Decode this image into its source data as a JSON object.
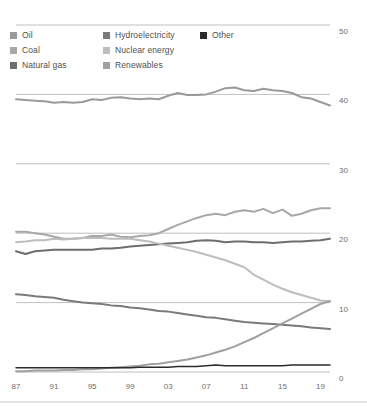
{
  "legend": {
    "columns": [
      {
        "items": [
          {
            "label": "Oil",
            "color": "#9a9a9a",
            "icon": "legend-swatch"
          },
          {
            "label": "Coal",
            "color": "#a8a8a8",
            "icon": "legend-swatch"
          },
          {
            "label": "Natural gas",
            "color": "#6e6e6e",
            "icon": "legend-swatch"
          }
        ]
      },
      {
        "items": [
          {
            "label": "Hydroelectricity",
            "color": "#7a7a7a",
            "icon": "legend-swatch"
          },
          {
            "label": "Nuclear energy",
            "color": "#bdbdbd",
            "icon": "legend-swatch"
          },
          {
            "label": "Renewables",
            "color": "#a0a0a0",
            "icon": "legend-swatch"
          }
        ]
      },
      {
        "items": [
          {
            "label": "Other",
            "color": "#2b2b2b",
            "icon": "legend-swatch"
          }
        ]
      }
    ]
  },
  "chart_data": {
    "type": "line",
    "title": "",
    "subtitle": "",
    "xlabel": "",
    "ylabel": "",
    "xlim": [
      1987,
      2020
    ],
    "ylim": [
      0,
      50
    ],
    "grid": true,
    "grid_axis": "y",
    "legend_position": "top",
    "x_ticks": [
      "87",
      "91",
      "95",
      "99",
      "03",
      "07",
      "11",
      "15",
      "19"
    ],
    "x_tick_values": [
      1987,
      1991,
      1995,
      1999,
      2003,
      2007,
      2011,
      2015,
      2019
    ],
    "y_ticks": [
      "0",
      "10",
      "20",
      "30",
      "40",
      "50"
    ],
    "y_tick_values": [
      0,
      10,
      20,
      30,
      40,
      50
    ],
    "x": [
      1987,
      1988,
      1989,
      1990,
      1991,
      1992,
      1993,
      1994,
      1995,
      1996,
      1997,
      1998,
      1999,
      2000,
      2001,
      2002,
      2003,
      2004,
      2005,
      2006,
      2007,
      2008,
      2009,
      2010,
      2011,
      2012,
      2013,
      2014,
      2015,
      2016,
      2017,
      2018,
      2019,
      2020
    ],
    "series": [
      {
        "name": "Oil",
        "color": "#9a9a9a",
        "width": 2.0,
        "values": [
          39.3,
          39.2,
          39.1,
          39.0,
          38.8,
          38.9,
          38.8,
          38.9,
          39.3,
          39.2,
          39.5,
          39.6,
          39.4,
          39.3,
          39.4,
          39.3,
          39.8,
          40.2,
          39.9,
          39.9,
          40.0,
          40.4,
          40.9,
          41.0,
          40.6,
          40.5,
          40.8,
          40.6,
          40.5,
          40.2,
          39.6,
          39.4,
          38.9,
          38.4
        ]
      },
      {
        "name": "Coal",
        "color": "#a8a8a8",
        "width": 2.0,
        "values": [
          20.2,
          20.2,
          20.0,
          19.8,
          19.5,
          19.2,
          19.2,
          19.3,
          19.6,
          19.6,
          19.8,
          19.5,
          19.4,
          19.6,
          19.7,
          20.0,
          20.6,
          21.2,
          21.7,
          22.2,
          22.6,
          22.8,
          22.6,
          23.1,
          23.3,
          23.1,
          23.5,
          22.9,
          23.4,
          22.5,
          22.8,
          23.3,
          23.6,
          23.6
        ]
      },
      {
        "name": "Natural gas",
        "color": "#6e6e6e",
        "width": 2.0,
        "values": [
          17.4,
          17.0,
          17.4,
          17.5,
          17.6,
          17.6,
          17.6,
          17.6,
          17.6,
          17.8,
          17.8,
          17.9,
          18.1,
          18.2,
          18.3,
          18.4,
          18.5,
          18.6,
          18.7,
          18.9,
          19.0,
          18.9,
          18.7,
          18.8,
          18.8,
          18.7,
          18.7,
          18.6,
          18.7,
          18.8,
          18.8,
          18.9,
          19.0,
          19.2
        ]
      },
      {
        "name": "Hydroelectricity",
        "color": "#7a7a7a",
        "width": 2.0,
        "values": [
          11.2,
          11.1,
          10.9,
          10.8,
          10.7,
          10.4,
          10.2,
          10.0,
          9.9,
          9.8,
          9.6,
          9.5,
          9.3,
          9.2,
          9.0,
          8.8,
          8.7,
          8.5,
          8.3,
          8.1,
          7.9,
          7.8,
          7.6,
          7.4,
          7.2,
          7.1,
          7.0,
          6.9,
          6.8,
          6.7,
          6.6,
          6.4,
          6.3,
          6.2
        ]
      },
      {
        "name": "Nuclear energy",
        "color": "#bdbdbd",
        "width": 2.0,
        "values": [
          18.7,
          18.8,
          19.0,
          19.0,
          19.2,
          19.1,
          19.2,
          19.3,
          19.3,
          19.3,
          19.2,
          19.2,
          19.2,
          19.0,
          18.8,
          18.5,
          18.2,
          17.9,
          17.6,
          17.3,
          16.9,
          16.5,
          16.1,
          15.6,
          15.1,
          14.0,
          13.3,
          12.6,
          12.0,
          11.5,
          11.1,
          10.7,
          10.3,
          10.2
        ]
      },
      {
        "name": "Renewables",
        "color": "#a0a0a0",
        "width": 2.0,
        "values": [
          0.1,
          0.1,
          0.2,
          0.2,
          0.2,
          0.3,
          0.3,
          0.4,
          0.4,
          0.5,
          0.6,
          0.7,
          0.8,
          0.9,
          1.1,
          1.2,
          1.4,
          1.6,
          1.8,
          2.1,
          2.4,
          2.8,
          3.2,
          3.7,
          4.3,
          4.9,
          5.6,
          6.3,
          7.0,
          7.7,
          8.4,
          9.1,
          9.8,
          10.2
        ]
      },
      {
        "name": "Other",
        "color": "#2b2b2b",
        "width": 1.5,
        "values": [
          0.6,
          0.6,
          0.6,
          0.6,
          0.6,
          0.6,
          0.6,
          0.6,
          0.6,
          0.6,
          0.6,
          0.6,
          0.6,
          0.7,
          0.7,
          0.7,
          0.7,
          0.8,
          0.8,
          0.8,
          0.9,
          1.0,
          0.9,
          0.9,
          0.9,
          0.9,
          0.9,
          0.9,
          0.9,
          1.0,
          1.0,
          1.0,
          1.0,
          1.0
        ]
      }
    ]
  }
}
